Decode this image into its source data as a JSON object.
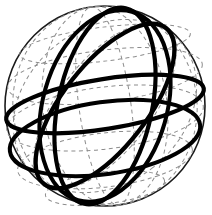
{
  "figure": {
    "type": "geometric-diagram",
    "width": 212,
    "height": 215,
    "background_color": "#ffffff"
  },
  "colors": {
    "outline": "#1a1a1a",
    "graticule": "#8c8c8c",
    "great_circle": "#000000",
    "fill": "#ffffff"
  },
  "sphere": {
    "center_x": 105,
    "center_y": 106,
    "radius": 100,
    "outline_width": 1.6
  },
  "graticule": {
    "style": "dashed",
    "stroke_width": 1.0,
    "dash_pattern": "4 3.5",
    "color": "#8c8c8c",
    "latitudes": [
      {
        "name": "latitude-north-high",
        "cx": 105,
        "cy": 44,
        "rx": 86,
        "ry": 17,
        "rotate": -7
      },
      {
        "name": "latitude-north-mid",
        "cx": 105,
        "cy": 76,
        "rx": 98,
        "ry": 26,
        "rotate": -7
      },
      {
        "name": "latitude-equator-dashed",
        "cx": 105,
        "cy": 118,
        "rx": 99,
        "ry": 31,
        "rotate": -7
      },
      {
        "name": "latitude-south-mid",
        "cx": 105,
        "cy": 160,
        "rx": 88,
        "ry": 27,
        "rotate": -7
      },
      {
        "name": "latitude-south-high",
        "cx": 105,
        "cy": 188,
        "rx": 60,
        "ry": 16,
        "rotate": -7
      }
    ],
    "meridians": [
      {
        "name": "meridian-dashed-a",
        "cx": 105,
        "cy": 106,
        "rx": 26,
        "ry": 100,
        "rotate": -8
      },
      {
        "name": "meridian-dashed-b",
        "cx": 105,
        "cy": 106,
        "rx": 62,
        "ry": 100,
        "rotate": -8
      },
      {
        "name": "meridian-dashed-c",
        "cx": 105,
        "cy": 106,
        "rx": 92,
        "ry": 100,
        "rotate": -8
      },
      {
        "name": "meridian-dashed-d",
        "cx": 105,
        "cy": 106,
        "rx": 46,
        "ry": 99,
        "rotate": 38
      },
      {
        "name": "meridian-dashed-e",
        "cx": 105,
        "cy": 106,
        "rx": 78,
        "ry": 99,
        "rotate": 52
      }
    ]
  },
  "great_circles": [
    {
      "name": "great-circle-equator",
      "description": "Bold near-horizontal equator ring, tilted slightly up to the right",
      "cx": 105,
      "cy": 104,
      "rx": 100,
      "ry": 25,
      "rotate": -9,
      "stroke_width": 4.2
    },
    {
      "name": "great-circle-tilted-major",
      "description": "Bold great circle steeply tilted, rising from lower-left to upper-right",
      "cx": 105,
      "cy": 106,
      "rx": 99,
      "ry": 42,
      "rotate": -52,
      "stroke_width": 4.2
    },
    {
      "name": "great-circle-meridian-right",
      "description": "Bold near-vertical meridian passing right of center",
      "cx": 105,
      "cy": 106,
      "rx": 47,
      "ry": 100,
      "rotate": 12,
      "stroke_width": 4.2
    },
    {
      "name": "great-circle-lower-band",
      "description": "Bold lower band arc sweeping across the southern region",
      "cx": 105,
      "cy": 138,
      "rx": 96,
      "ry": 36,
      "rotate": -8,
      "stroke_width": 4.0
    },
    {
      "name": "great-circle-left-limb",
      "description": "Bold arc hugging the left limb of the sphere",
      "cx": 105,
      "cy": 106,
      "rx": 98,
      "ry": 62,
      "rotate": -74,
      "stroke_width": 4.0
    }
  ],
  "labels": {
    "visible_text": []
  }
}
